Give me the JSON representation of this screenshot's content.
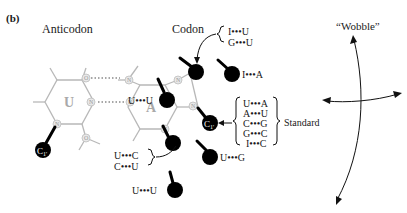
{
  "figure": {
    "panel_label": "(b)",
    "headers": {
      "anticodon": "Anticodon",
      "codon": "Codon",
      "wobble": "“Wobble”"
    },
    "bases": {
      "anticodon_base": "U",
      "codon_base": "A",
      "ring_atom_n": "N",
      "ring_atom_o": "O",
      "c1_label": "C1'"
    },
    "pairs": {
      "central": "U•••U",
      "top_bracket": [
        "I•••U",
        "G•••U"
      ],
      "top_right": "I•••A",
      "standard": [
        "U•••A",
        "A•••U",
        "C•••G",
        "G•••C",
        "I•••C"
      ],
      "standard_label": "Standard",
      "lower_bracket": [
        "U•••C",
        "C•••U"
      ],
      "lower_right": "U•••G",
      "bottom": "U•••U"
    },
    "colors": {
      "ring": "#b8b8b8",
      "ball": "#000000",
      "text": "#1a1a1a"
    }
  }
}
